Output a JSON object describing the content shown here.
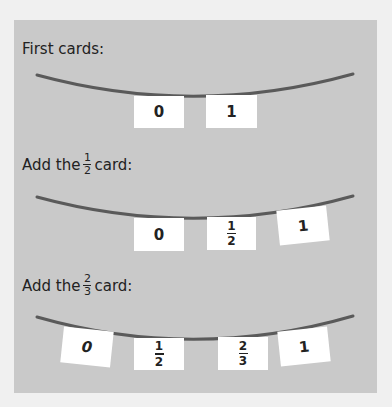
{
  "header": {
    "cut_text": ""
  },
  "colors": {
    "page_bg": "#f0f0f0",
    "panel_bg": "#c9c9c9",
    "string": "#5a5a5a",
    "card": "#ffffff",
    "text": "#222222"
  },
  "sections": [
    {
      "label_prefix": "First cards:",
      "label_frac": null,
      "label_suffix": "",
      "cards": [
        {
          "num": "0"
        },
        {
          "num": "1"
        }
      ]
    },
    {
      "label_prefix": "Add the",
      "label_frac": {
        "n": "1",
        "d": "2"
      },
      "label_suffix": "card:",
      "cards": [
        {
          "num": "0"
        },
        {
          "n": "1",
          "d": "2"
        },
        {
          "num": "1"
        }
      ]
    },
    {
      "label_prefix": "Add the",
      "label_frac": {
        "n": "2",
        "d": "3"
      },
      "label_suffix": "card:",
      "cards": [
        {
          "num": "0"
        },
        {
          "n": "1",
          "d": "2"
        },
        {
          "n": "2",
          "d": "3"
        },
        {
          "num": "1"
        }
      ]
    }
  ]
}
